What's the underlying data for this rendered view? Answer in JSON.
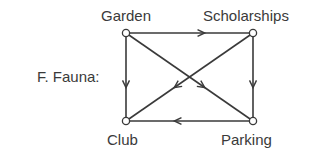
{
  "title": "F. Fauna:",
  "nodes": [
    {
      "id": "garden",
      "label": "Garden",
      "x": 126,
      "y": 33
    },
    {
      "id": "scholarships",
      "label": "Scholarships",
      "x": 253,
      "y": 33
    },
    {
      "id": "club",
      "label": "Club",
      "x": 126,
      "y": 121
    },
    {
      "id": "parking",
      "label": "Parking",
      "x": 253,
      "y": 121
    }
  ],
  "edges": [
    {
      "from": "garden",
      "to": "scholarships"
    },
    {
      "from": "garden",
      "to": "club"
    },
    {
      "from": "garden",
      "to": "parking"
    },
    {
      "from": "scholarships",
      "to": "parking"
    },
    {
      "from": "scholarships",
      "to": "club"
    },
    {
      "from": "parking",
      "to": "club"
    }
  ],
  "colors": {
    "stroke": "#3a3a3a",
    "node_fill": "#ffffff"
  }
}
